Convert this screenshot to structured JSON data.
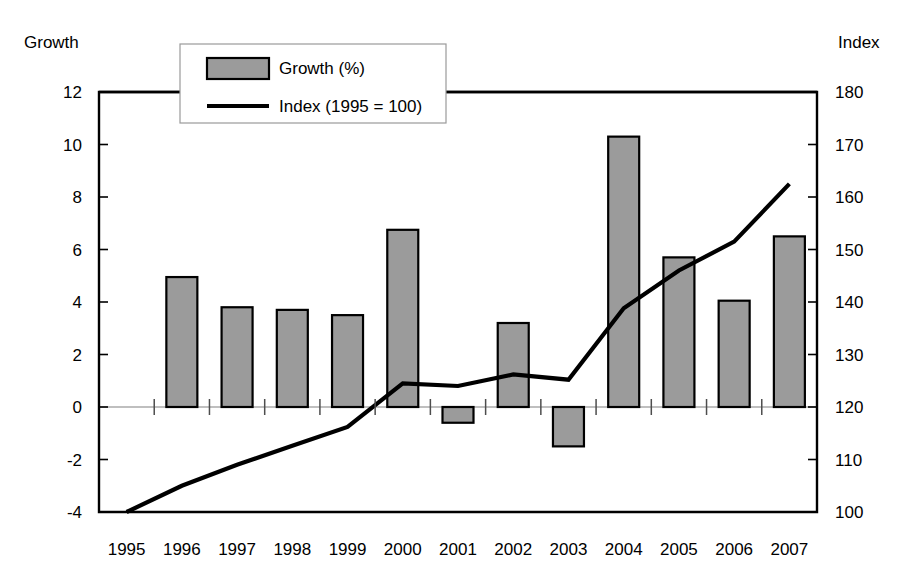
{
  "chart_data": {
    "type": "bar",
    "title": "",
    "subtitle": "",
    "xlabel": "",
    "ylabel": "Growth",
    "y2label": "Index",
    "grid": false,
    "legend_position": "top-left-inside",
    "categories": [
      "1995",
      "1996",
      "1997",
      "1998",
      "1999",
      "2000",
      "2001",
      "2002",
      "2003",
      "2004",
      "2005",
      "2006",
      "2007"
    ],
    "ylim": [
      -4,
      12
    ],
    "yticks": [
      "12",
      "10",
      "8",
      "6",
      "4",
      "2",
      "0",
      "-2",
      "-4"
    ],
    "ytick_values": [
      12,
      10,
      8,
      6,
      4,
      2,
      0,
      -2,
      -4
    ],
    "y2lim": [
      100,
      180
    ],
    "y2ticks": [
      "180",
      "170",
      "160",
      "150",
      "140",
      "130",
      "120",
      "110",
      "100"
    ],
    "y2tick_values": [
      180,
      170,
      160,
      150,
      140,
      130,
      120,
      110,
      100
    ],
    "series": [
      {
        "name": "Growth (%)",
        "kind": "bar",
        "axis": "left",
        "color": "#9b9b9b",
        "edge_color": "#000000",
        "values": [
          null,
          4.95,
          3.8,
          3.7,
          3.5,
          6.75,
          -0.6,
          3.2,
          -1.5,
          10.3,
          5.7,
          4.05,
          6.5
        ]
      },
      {
        "name": "Index (1995 = 100)",
        "kind": "line",
        "axis": "right",
        "color": "#000000",
        "values": [
          100.0,
          105.0,
          109.0,
          112.6,
          116.2,
          124.5,
          124.0,
          126.2,
          125.2,
          138.8,
          146.0,
          151.5,
          162.5
        ]
      }
    ]
  },
  "legend": {
    "items": [
      {
        "label": "Growth (%)",
        "marker": "filled-rect",
        "color": "#9b9b9b"
      },
      {
        "label": "Index (1995 = 100)",
        "marker": "line",
        "color": "#000000"
      }
    ]
  },
  "labels": {
    "left_axis_title": "Growth",
    "right_axis_title": "Index"
  }
}
